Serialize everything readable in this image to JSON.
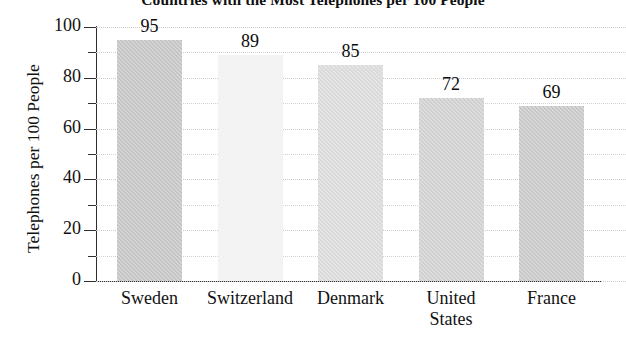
{
  "chart_data": {
    "type": "bar",
    "title": "Countries with the Most Telephones per 100 People",
    "xlabel": "",
    "ylabel": "Telephones per 100 People",
    "categories": [
      "Sweden",
      "Switzerland",
      "Denmark",
      "United States",
      "France"
    ],
    "values": [
      95,
      89,
      85,
      72,
      69
    ],
    "value_labels": [
      "95",
      "89",
      "85",
      "72",
      "69"
    ],
    "category_lines": [
      [
        "Sweden"
      ],
      [
        "Switzerland"
      ],
      [
        "Denmark"
      ],
      [
        "United",
        "States"
      ],
      [
        "France"
      ]
    ],
    "ylim": [
      0,
      100
    ],
    "ytick_labels": [
      "0",
      "20",
      "40",
      "60",
      "80",
      "100"
    ],
    "ytick_values": [
      0,
      20,
      40,
      60,
      80,
      100
    ],
    "yminor_values": [
      10,
      30,
      50,
      70,
      90
    ],
    "grid": true,
    "grid_style": "dotted-horizontal",
    "legend": false,
    "bar_colors": [
      "#c3c3c3",
      "#f1f1f1",
      "#d9d9d9",
      "#cfcfcf",
      "#c6c6c6"
    ],
    "axis_color": "#2e2e2e",
    "grid_color": "#d2d2d2"
  }
}
